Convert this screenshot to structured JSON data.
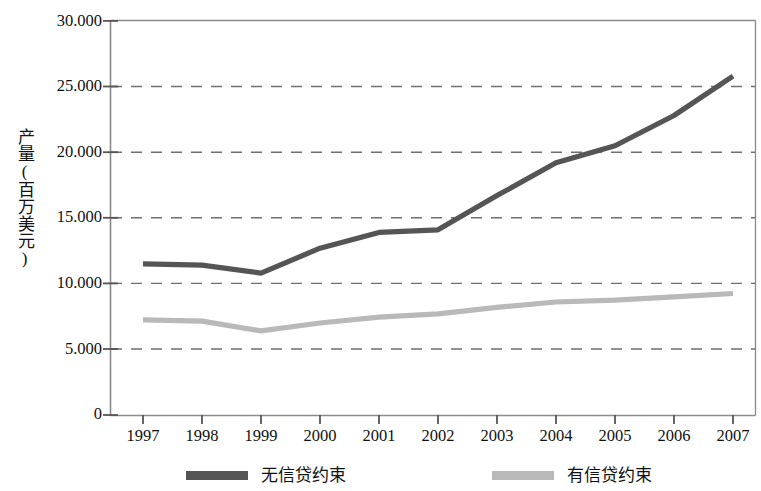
{
  "chart_data": {
    "type": "line",
    "title": "",
    "xlabel": "",
    "ylabel": "产量(百万美元)",
    "x": [
      1997,
      1998,
      1999,
      2000,
      2001,
      2002,
      2003,
      2004,
      2005,
      2006,
      2007
    ],
    "xtick_labels": [
      "1997",
      "1998",
      "1999",
      "2000",
      "2001",
      "2002",
      "2003",
      "2004",
      "2005",
      "2006",
      "2007"
    ],
    "ytick_labels": [
      "0",
      "5.000",
      "10.000",
      "15.000",
      "20.000",
      "25.000",
      "30.000"
    ],
    "ytick_values": [
      0,
      5000,
      10000,
      15000,
      20000,
      25000,
      30000
    ],
    "ylim": [
      0,
      30000
    ],
    "xlim": [
      1997,
      2007
    ],
    "grid": "horizontal-dashed",
    "legend_position": "bottom",
    "series": [
      {
        "name": "无信贷约束",
        "color": "#555555",
        "values": [
          11500,
          11400,
          10800,
          12700,
          13900,
          14100,
          16700,
          19200,
          20500,
          22800,
          25800
        ]
      },
      {
        "name": "有信贷约束",
        "color": "#b9b9b9",
        "values": [
          7250,
          7150,
          6400,
          7000,
          7450,
          7700,
          8200,
          8600,
          8750,
          9000,
          9250
        ]
      }
    ]
  },
  "legend": {
    "items": [
      {
        "label": "无信贷约束",
        "color": "#555555"
      },
      {
        "label": "有信贷约束",
        "color": "#b9b9b9"
      }
    ]
  },
  "axes": {
    "y_title": "产量(百万美元)",
    "y_labels": [
      "30.000",
      "25.000",
      "20.000",
      "15.000",
      "10.000",
      "5.000",
      "0"
    ],
    "x_labels": [
      "1997",
      "1998",
      "1999",
      "2000",
      "2001",
      "2002",
      "2003",
      "2004",
      "2005",
      "2006",
      "2007"
    ]
  },
  "colors": {
    "series_dark": "#555555",
    "series_light": "#b9b9b9",
    "grid": "#666666",
    "frame": "#888888",
    "text": "#111111"
  }
}
